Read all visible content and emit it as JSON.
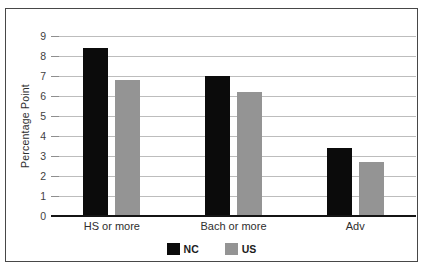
{
  "chart_data": {
    "type": "bar",
    "ylabel": "Percentage Point",
    "categories": [
      "HS or more",
      "Bach or more",
      "Adv"
    ],
    "series": [
      {
        "name": "NC",
        "color": "#0b0b0b",
        "values": [
          8.4,
          7.0,
          3.4
        ]
      },
      {
        "name": "US",
        "color": "#949494",
        "values": [
          6.8,
          6.2,
          2.7
        ]
      }
    ],
    "ylim": [
      0,
      9
    ],
    "yticks": [
      0,
      1,
      2,
      3,
      4,
      5,
      6,
      7,
      8,
      9
    ],
    "grid": "horizontal",
    "legend_position": "bottom"
  },
  "colors": {
    "grid": "#bdbdbd",
    "tick": "#8f8f8f",
    "axis": "#141414",
    "frame_border": "#474747",
    "background": "#ffffff"
  }
}
